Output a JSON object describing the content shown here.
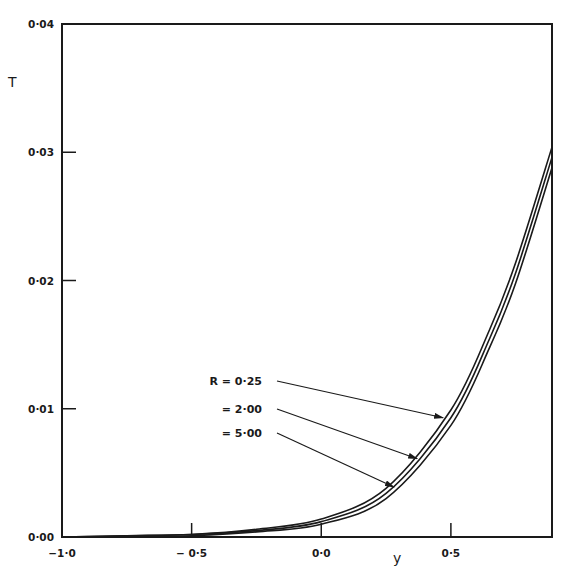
{
  "chart_data": {
    "type": "line",
    "title": "",
    "xlabel": "y",
    "ylabel": "T",
    "xlim": [
      -1.0,
      0.89
    ],
    "ylim": [
      0.0,
      0.04
    ],
    "grid": false,
    "x_ticks": [
      -1.0,
      -0.5,
      0.0,
      0.5
    ],
    "x_tick_labels": [
      "−1·0",
      "− 0·5",
      "0·0",
      "0·5"
    ],
    "y_ticks": [
      0.0,
      0.01,
      0.02,
      0.03,
      0.04
    ],
    "y_tick_labels": [
      "0·00",
      "0·01",
      "0·02",
      "0·03",
      "0·04"
    ],
    "legend_position": "inline annotations with arrows, middle-left",
    "x": [
      -1.0,
      -0.75,
      -0.5,
      -0.25,
      0.0,
      0.25,
      0.5,
      0.65,
      0.75,
      0.89
    ],
    "series": [
      {
        "name": "R = 0.25",
        "label": "R = 0·25",
        "values": [
          0.0,
          0.0001,
          0.0002,
          0.0006,
          0.0014,
          0.0038,
          0.0099,
          0.0162,
          0.0214,
          0.0304
        ]
      },
      {
        "name": "R = 2.00",
        "label": "= 2·00",
        "values": [
          0.0,
          0.0001,
          0.0002,
          0.0005,
          0.0012,
          0.0034,
          0.0093,
          0.0155,
          0.0206,
          0.0296
        ]
      },
      {
        "name": "R = 5.00",
        "label": "= 5·00",
        "values": [
          0.0,
          0.0,
          0.0001,
          0.0004,
          0.001,
          0.003,
          0.0087,
          0.0148,
          0.0198,
          0.0288
        ]
      }
    ],
    "annotations": [
      {
        "text": "R = 0·25",
        "arrow_to_series": "R = 0.25",
        "arrow_target": [
          0.47,
          0.0093
        ]
      },
      {
        "text": "= 2·00",
        "arrow_to_series": "R = 2.00",
        "arrow_target": [
          0.37,
          0.0061
        ]
      },
      {
        "text": "= 5·00",
        "arrow_to_series": "R = 5.00",
        "arrow_target": [
          0.28,
          0.0039
        ]
      }
    ]
  }
}
